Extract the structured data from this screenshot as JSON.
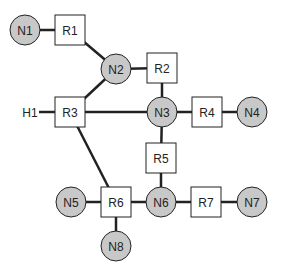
{
  "diagram": {
    "colors": {
      "node_fill": "#c8c8c8",
      "router_fill": "#ffffff",
      "stroke": "#222222",
      "edge": "#222222"
    },
    "networks": [
      {
        "id": "N1",
        "label": "N1",
        "x": 25,
        "y": 30
      },
      {
        "id": "N2",
        "label": "N2",
        "x": 116,
        "y": 69
      },
      {
        "id": "N3",
        "label": "N3",
        "x": 162,
        "y": 112
      },
      {
        "id": "N4",
        "label": "N4",
        "x": 252,
        "y": 112
      },
      {
        "id": "N5",
        "label": "N5",
        "x": 71,
        "y": 202
      },
      {
        "id": "N6",
        "label": "N6",
        "x": 161,
        "y": 202
      },
      {
        "id": "N7",
        "label": "N7",
        "x": 252,
        "y": 202
      },
      {
        "id": "N8",
        "label": "N8",
        "x": 116,
        "y": 246
      }
    ],
    "routers": [
      {
        "id": "R1",
        "label": "R1",
        "x": 70,
        "y": 30
      },
      {
        "id": "R2",
        "label": "R2",
        "x": 162,
        "y": 68
      },
      {
        "id": "R3",
        "label": "R3",
        "x": 70,
        "y": 112
      },
      {
        "id": "R4",
        "label": "R4",
        "x": 207,
        "y": 112
      },
      {
        "id": "R5",
        "label": "R5",
        "x": 161,
        "y": 158
      },
      {
        "id": "R6",
        "label": "R6",
        "x": 116,
        "y": 202
      },
      {
        "id": "R7",
        "label": "R7",
        "x": 206,
        "y": 202
      }
    ],
    "hosts": [
      {
        "id": "H1",
        "label": "H1",
        "x": 30,
        "y": 112
      }
    ],
    "edges": [
      [
        "N1",
        "R1"
      ],
      [
        "R1",
        "N2"
      ],
      [
        "N2",
        "R2"
      ],
      [
        "N2",
        "R3"
      ],
      [
        "H1",
        "R3"
      ],
      [
        "R3",
        "N3"
      ],
      [
        "R2",
        "N3"
      ],
      [
        "N3",
        "R4"
      ],
      [
        "R4",
        "N4"
      ],
      [
        "N3",
        "R5"
      ],
      [
        "R5",
        "N6"
      ],
      [
        "R3",
        "R6"
      ],
      [
        "N5",
        "R6"
      ],
      [
        "R6",
        "N6"
      ],
      [
        "N6",
        "R7"
      ],
      [
        "R7",
        "N7"
      ],
      [
        "R6",
        "N8"
      ]
    ]
  }
}
